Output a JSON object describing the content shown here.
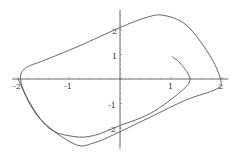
{
  "chart_data": {
    "type": "line",
    "subtype": "parametric",
    "title": "",
    "xlabel": "",
    "ylabel": "",
    "xlim": [
      -2.0,
      2.1
    ],
    "ylim": [
      -2.75,
      2.7
    ],
    "grid": false,
    "legend": null,
    "x_ticks": [
      -2,
      -1,
      1,
      2
    ],
    "x_tick_labels": [
      "-2",
      "-1",
      "1",
      "2"
    ],
    "y_ticks": [
      -2,
      -1,
      1,
      2
    ],
    "y_tick_labels": [
      "-2",
      "-1",
      "1",
      "2"
    ],
    "series": [
      {
        "name": "trajectory",
        "color": "#555555",
        "points": [
          [
            1.02,
            0.92
          ],
          [
            1.2,
            0.6
          ],
          [
            1.37,
            0.0
          ],
          [
            1.2,
            -0.5
          ],
          [
            0.6,
            -1.4
          ],
          [
            0.0,
            -1.9
          ],
          [
            -0.5,
            -2.3
          ],
          [
            -0.9,
            -2.35
          ],
          [
            -1.4,
            -2.0
          ],
          [
            -1.8,
            -0.85
          ],
          [
            -1.95,
            0.0
          ],
          [
            -1.85,
            0.45
          ],
          [
            -1.5,
            0.75
          ],
          [
            -0.8,
            1.35
          ],
          [
            0.0,
            2.1
          ],
          [
            0.5,
            2.5
          ],
          [
            0.85,
            2.6
          ],
          [
            1.3,
            2.2
          ],
          [
            1.75,
            1.0
          ],
          [
            1.97,
            0.0
          ],
          [
            1.9,
            -0.4
          ],
          [
            1.3,
            -0.85
          ],
          [
            0.6,
            -1.55
          ],
          [
            0.0,
            -2.15
          ],
          [
            -0.5,
            -2.6
          ],
          [
            -0.9,
            -2.65
          ],
          [
            -1.6,
            -1.55
          ],
          [
            -2.0,
            0.0
          ]
        ]
      }
    ]
  },
  "axes": {
    "x_labels": [
      "-2",
      "-1",
      "1",
      "2"
    ],
    "y_labels": [
      "2",
      "1",
      "-1",
      "-2"
    ]
  }
}
